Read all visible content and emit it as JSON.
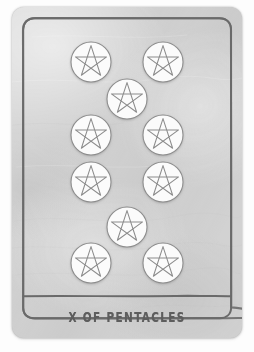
{
  "card": {
    "name": "X of Pentacles",
    "suit": "Pentacles",
    "rank": "X",
    "title_label": "X OF PENTACLES",
    "deck_style": "hand-drawn minimal tarot",
    "colors": {
      "page_background": "#fdfdfd",
      "card_background": "#d2d2d2",
      "border_ink": "#6a6a6a",
      "title_ink": "#5d5d5d",
      "pentacle_fill": "#fbfbfb",
      "pentacle_ink": "#8c8c8c"
    },
    "geometry": {
      "card_left": 12,
      "card_top": 7,
      "card_width": 230,
      "card_height": 331,
      "card_radius": 12,
      "frame_inset": 11,
      "title_divider_y": 289
    },
    "pentacle_radius": 20,
    "pentacle_count": 10,
    "pentacles": [
      {
        "id": "pentacle-1",
        "cx": 79,
        "cy": 55,
        "r": 20,
        "column": "left",
        "row": 1
      },
      {
        "id": "pentacle-2",
        "cx": 151,
        "cy": 55,
        "r": 20,
        "column": "right",
        "row": 1
      },
      {
        "id": "pentacle-3",
        "cx": 115,
        "cy": 92,
        "r": 20,
        "column": "center",
        "row": 2
      },
      {
        "id": "pentacle-4",
        "cx": 79,
        "cy": 128,
        "r": 20,
        "column": "left",
        "row": 3
      },
      {
        "id": "pentacle-5",
        "cx": 151,
        "cy": 128,
        "r": 20,
        "column": "right",
        "row": 3
      },
      {
        "id": "pentacle-6",
        "cx": 79,
        "cy": 175,
        "r": 20,
        "column": "left",
        "row": 4
      },
      {
        "id": "pentacle-7",
        "cx": 151,
        "cy": 175,
        "r": 20,
        "column": "right",
        "row": 4
      },
      {
        "id": "pentacle-8",
        "cx": 115,
        "cy": 220,
        "r": 20,
        "column": "center",
        "row": 5
      },
      {
        "id": "pentacle-9",
        "cx": 79,
        "cy": 256,
        "r": 20,
        "column": "left",
        "row": 6
      },
      {
        "id": "pentacle-10",
        "cx": 151,
        "cy": 256,
        "r": 20,
        "column": "right",
        "row": 6
      }
    ]
  }
}
